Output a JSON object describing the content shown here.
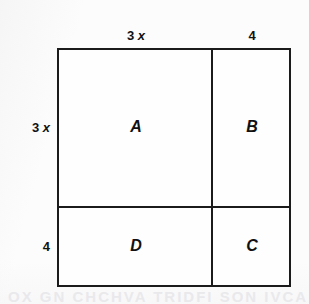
{
  "figure": {
    "ink_color": "#1b1b1b",
    "background_color": "#fcfcfc",
    "ghost_text_bottom": "OX  GN  CHCHVA  TRIDFI SON IVCA",
    "ghost_text_middle": "ON THE  RIO"
  },
  "regions": {
    "top_left": "A",
    "top_right": "B",
    "bottom_right": "C",
    "bottom_left": "D"
  },
  "dimensions": {
    "top_left_coefficient": "3",
    "top_left_variable": "x",
    "top_right": "4",
    "left_upper_coefficient": "3",
    "left_upper_variable": "x",
    "left_lower": "4"
  },
  "chart_data": {
    "type": "diagram",
    "subtype": "area-model",
    "outer_rect": {
      "x": 57,
      "y": 48,
      "width": 234,
      "height": 239
    },
    "vertical_divider_x": 212,
    "horizontal_divider_y": 207,
    "cells": [
      {
        "name": "A",
        "position": "top-left",
        "width_expr": "3x",
        "height_expr": "3x",
        "area_expr": "9x^2"
      },
      {
        "name": "B",
        "position": "top-right",
        "width_expr": "4",
        "height_expr": "3x",
        "area_expr": "12x"
      },
      {
        "name": "C",
        "position": "bottom-right",
        "width_expr": "4",
        "height_expr": "4",
        "area_expr": "16"
      },
      {
        "name": "D",
        "position": "bottom-left",
        "width_expr": "3x",
        "height_expr": "4",
        "area_expr": "12x"
      }
    ],
    "edge_labels": {
      "top": [
        "3 x",
        "4"
      ],
      "left": [
        "3 x",
        "4"
      ]
    },
    "total_side_expr": "3x + 4",
    "total_area_expr": "(3x + 4)^2"
  }
}
